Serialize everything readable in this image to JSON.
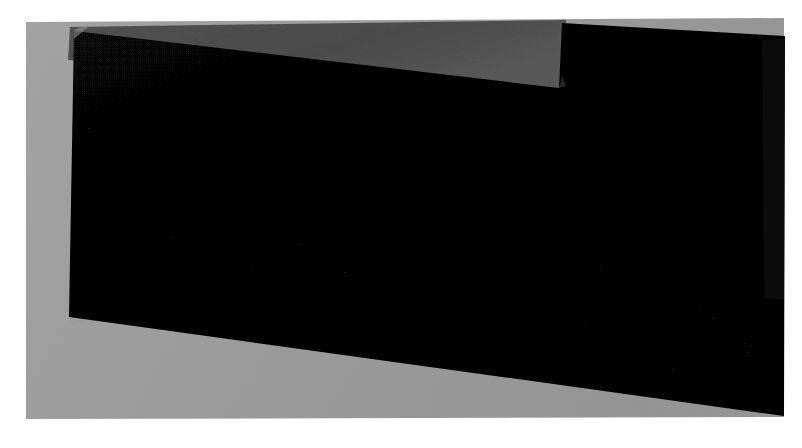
{
  "image": {
    "kind": "photograph",
    "subject": "powered-off-display-screen",
    "description": "Photograph of a dark, powered-off flat display screen resting on a gray surface, captured at a slight clockwise rotation, surrounded by a white border.",
    "width_px": 802,
    "height_px": 448,
    "visible_text": "",
    "orientation_note": "rotated slightly, top edge tilts downward toward the right"
  },
  "colors": {
    "outer_background": "#ffffff",
    "mat_light_gray": "#9a9a9a",
    "mat_dark_gray": "#4a4a4a",
    "screen_black": "#050505",
    "screen_edge": "#0a0a0a",
    "bezel_shadow": "#111111"
  },
  "regions": [
    {
      "name": "outer-background",
      "label": "White page background",
      "fill": "#ffffff",
      "shape": "rectangle"
    },
    {
      "name": "gray-mat",
      "label": "Light gray backing surface",
      "fill": "#9a9a9a",
      "shape": "rotated-quadrilateral",
      "points": "26,23 783,19 783,415 26,418"
    },
    {
      "name": "dark-gray-band",
      "label": "Darker gray band along upper area",
      "fill": "#4a4a4a",
      "shape": "rotated-quadrilateral",
      "points": "72,27 565,22 565,88 72,60"
    },
    {
      "name": "screen-main",
      "label": "Black display screen panel",
      "fill": "#050505",
      "shape": "rotated-quadrilateral",
      "points": "74,30 560,86 563,22 784,35 784,414 70,316"
    },
    {
      "name": "screen-notch",
      "label": "Step notch at top of screen outline",
      "fill": "#4a4a4a",
      "shape": "notch"
    }
  ],
  "geometry": {
    "screen_polygon": "74,31 559,87 562,23 784,36 783,415 70,317",
    "mat_polygon": "26,22 784,18 784,417 26,419",
    "dark_band_polygon": "72,27 564,21 561,88 70,59",
    "rotation_degrees": -1.2
  },
  "specks": [
    {
      "x": 199,
      "y": 62
    },
    {
      "x": 88,
      "y": 128
    },
    {
      "x": 299,
      "y": 244
    },
    {
      "x": 344,
      "y": 272
    },
    {
      "x": 601,
      "y": 268
    },
    {
      "x": 585,
      "y": 325
    },
    {
      "x": 700,
      "y": 305
    },
    {
      "x": 712,
      "y": 318
    },
    {
      "x": 745,
      "y": 343
    },
    {
      "x": 751,
      "y": 346
    },
    {
      "x": 748,
      "y": 352
    },
    {
      "x": 673,
      "y": 369
    },
    {
      "x": 172,
      "y": 237
    },
    {
      "x": 252,
      "y": 270
    }
  ]
}
